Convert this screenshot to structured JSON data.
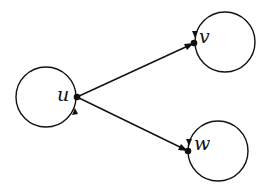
{
  "diagram": {
    "type": "directed-graph",
    "nodes": [
      {
        "id": "u",
        "label": "u",
        "x": 77,
        "y": 97,
        "self_loop": true
      },
      {
        "id": "v",
        "label": "v",
        "x": 194,
        "y": 43,
        "self_loop": true
      },
      {
        "id": "w",
        "label": "w",
        "x": 188,
        "y": 151,
        "self_loop": true
      }
    ],
    "edges": [
      {
        "from": "u",
        "to": "v"
      },
      {
        "from": "u",
        "to": "w"
      },
      {
        "from": "u",
        "to": "u"
      },
      {
        "from": "v",
        "to": "v"
      },
      {
        "from": "w",
        "to": "w"
      }
    ],
    "colors": {
      "stroke": "#111111",
      "background": "#ffffff"
    }
  }
}
